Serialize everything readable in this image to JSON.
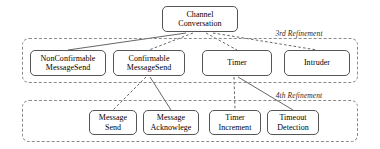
{
  "diagram": {
    "root": {
      "id": "channel-conversation",
      "label": "Channel\nConversation",
      "x": 162,
      "y": 6,
      "w": 76,
      "h": 26
    },
    "groups": [
      {
        "id": "third-refinement",
        "label": "3rd Refinement",
        "x": 22,
        "y": 38,
        "w": 336,
        "h": 45,
        "label_x": 299,
        "label_y": 29
      },
      {
        "id": "fourth-refinement",
        "label": "4th Refinement",
        "x": 22,
        "y": 100,
        "w": 336,
        "h": 42,
        "label_x": 299,
        "label_y": 91
      }
    ],
    "nodes": [
      {
        "id": "nonconfirmable-messagesend",
        "label": "NonConfirmable\nMessageSend",
        "x": 30,
        "y": 50,
        "w": 76,
        "h": 26,
        "group": "third-refinement"
      },
      {
        "id": "confirmable-messagesend",
        "label": "Confirmable\nMessageSend",
        "x": 113,
        "y": 50,
        "w": 72,
        "h": 26,
        "group": "third-refinement"
      },
      {
        "id": "timer",
        "label": "Timer",
        "x": 202,
        "y": 50,
        "w": 70,
        "h": 26,
        "group": "third-refinement"
      },
      {
        "id": "intruder",
        "label": "Intruder",
        "x": 284,
        "y": 50,
        "w": 66,
        "h": 26,
        "group": "third-refinement"
      },
      {
        "id": "message-send",
        "label": "Message\nSend",
        "x": 89,
        "y": 110,
        "w": 48,
        "h": 25,
        "group": "fourth-refinement"
      },
      {
        "id": "message-acknowlege",
        "label": "Message\nAcknowlege",
        "x": 143,
        "y": 110,
        "w": 56,
        "h": 25,
        "group": "fourth-refinement"
      },
      {
        "id": "timer-increment",
        "label": "Timer\nIncrement",
        "x": 209,
        "y": 110,
        "w": 52,
        "h": 25,
        "group": "fourth-refinement"
      },
      {
        "id": "timeout-detection",
        "label": "Timeout\nDetection",
        "x": 267,
        "y": 110,
        "w": 52,
        "h": 25,
        "group": "fourth-refinement"
      }
    ],
    "edges": [
      {
        "id": "edge-root-nonconfirmable",
        "from": "channel-conversation",
        "to": "nonconfirmable-messagesend",
        "style": "solid",
        "x1": 186,
        "y1": 33,
        "x2": 68,
        "y2": 50
      },
      {
        "id": "edge-root-confirmable",
        "from": "channel-conversation",
        "to": "confirmable-messagesend",
        "style": "dashed",
        "x1": 193,
        "y1": 33,
        "x2": 149,
        "y2": 50
      },
      {
        "id": "edge-root-timer",
        "from": "channel-conversation",
        "to": "timer",
        "style": "dashed",
        "x1": 206,
        "y1": 33,
        "x2": 237,
        "y2": 50
      },
      {
        "id": "edge-root-intruder",
        "from": "channel-conversation",
        "to": "intruder",
        "style": "dashed",
        "x1": 213,
        "y1": 33,
        "x2": 317,
        "y2": 50
      },
      {
        "id": "edge-confirmable-messagesend",
        "from": "confirmable-messagesend",
        "to": "message-send",
        "style": "dashed",
        "x1": 146,
        "y1": 77,
        "x2": 113,
        "y2": 110
      },
      {
        "id": "edge-confirmable-acknowlege",
        "from": "confirmable-messagesend",
        "to": "message-acknowlege",
        "style": "solid",
        "x1": 150,
        "y1": 77,
        "x2": 171,
        "y2": 110
      },
      {
        "id": "edge-timer-increment",
        "from": "timer",
        "to": "timer-increment",
        "style": "dashed",
        "x1": 234,
        "y1": 77,
        "x2": 235,
        "y2": 110
      },
      {
        "id": "edge-timer-timeout",
        "from": "timer",
        "to": "timeout-detection",
        "style": "solid",
        "x1": 238,
        "y1": 77,
        "x2": 293,
        "y2": 110
      }
    ],
    "colors": {
      "node_border": "#555555",
      "group_border": "#8a8a8a",
      "edge": "#555555",
      "text": "#000000",
      "background": "#ffffff"
    }
  }
}
